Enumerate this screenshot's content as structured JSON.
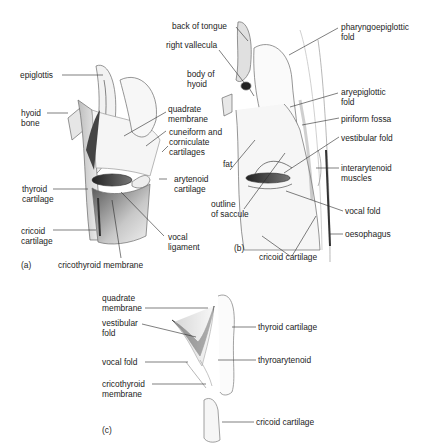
{
  "figure": {
    "panels": [
      {
        "id": "a",
        "tag": "(a)",
        "labels": [
          {
            "key": "epiglottis",
            "text": "epiglottis"
          },
          {
            "key": "hyoid_bone",
            "text": "hyoid\nbone"
          },
          {
            "key": "quadrate_membrane",
            "text": "quadrate\nmembrane"
          },
          {
            "key": "cuneiform",
            "text": "cuneiform and\ncorniculate\ncartilages"
          },
          {
            "key": "thyroid_cartilage",
            "text": "thyroid\ncartilage"
          },
          {
            "key": "arytenoid_cartilage",
            "text": "arytenoid\ncartilage"
          },
          {
            "key": "cricoid_cartilage",
            "text": "cricoid\ncartilage"
          },
          {
            "key": "vocal_ligament",
            "text": "vocal\nligament"
          },
          {
            "key": "cricothyroid_membrane",
            "text": "cricothyroid membrane"
          }
        ]
      },
      {
        "id": "b",
        "tag": "(b)",
        "labels": [
          {
            "key": "back_of_tongue",
            "text": "back of tongue"
          },
          {
            "key": "right_vallecula",
            "text": "right vallecula"
          },
          {
            "key": "body_of_hyoid",
            "text": "body of\nhyoid"
          },
          {
            "key": "pharyngoepiglottic_fold",
            "text": "pharyngoepiglottic\nfold"
          },
          {
            "key": "aryepiglottic_fold",
            "text": "aryepiglottic\nfold"
          },
          {
            "key": "piriform_fossa",
            "text": "piriform fossa"
          },
          {
            "key": "vestibular_fold",
            "text": "vestibular fold"
          },
          {
            "key": "fat",
            "text": "fat"
          },
          {
            "key": "interarytenoid_muscles",
            "text": "interarytenoid\nmuscles"
          },
          {
            "key": "outline_of_saccule",
            "text": "outline\nof saccule"
          },
          {
            "key": "vocal_fold",
            "text": "vocal fold"
          },
          {
            "key": "oesophagus",
            "text": "oesophagus"
          },
          {
            "key": "cricoid_cartilage",
            "text": "cricoid cartilage"
          }
        ]
      },
      {
        "id": "c",
        "tag": "(c)",
        "labels": [
          {
            "key": "quadrate_membrane",
            "text": "quadrate\nmembrane"
          },
          {
            "key": "vestibular_fold",
            "text": "vestibular\nfold"
          },
          {
            "key": "thyroid_cartilage",
            "text": "thyroid cartilage"
          },
          {
            "key": "vocal_fold",
            "text": "vocal fold"
          },
          {
            "key": "thyroarytenoid",
            "text": "thyroarytenoid"
          },
          {
            "key": "cricothyroid_membrane",
            "text": "cricothyroid\nmembrane"
          },
          {
            "key": "cricoid_cartilage",
            "text": "cricoid cartilage"
          }
        ]
      }
    ],
    "colors": {
      "line": "#2a2a2a",
      "ink": "#1c1c1c",
      "shade_dark": "#3a3a3a",
      "shade_mid": "#9a9a9a",
      "shade_light": "#d8d8d8"
    }
  }
}
